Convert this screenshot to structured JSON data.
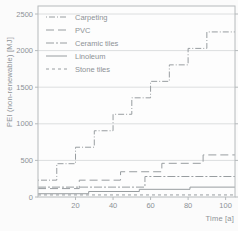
{
  "figure": {
    "background": "#fbfbfb",
    "line_color": "#989da0",
    "text_color": "#8d9296",
    "grid_color": "#dcdedf",
    "spine_color": "#b6babc"
  },
  "chart_data": {
    "type": "line",
    "subtype": "step-cumulative",
    "title": "",
    "xlabel": "Time [a]",
    "ylabel": "PEI (non-renewable) [MJ]",
    "xlim": [
      0,
      105
    ],
    "ylim": [
      0,
      2500
    ],
    "x_ticks": [
      20,
      40,
      60,
      80,
      100
    ],
    "y_ticks": [
      0,
      500,
      1000,
      1500,
      2000,
      2500
    ],
    "grid": "horizontal",
    "legend_position": "top-left",
    "series": [
      {
        "name": "Carpeting",
        "style": "dot-dash",
        "dash": "1 2 6 2",
        "start": 230,
        "steps": [
          [
            10,
            455
          ],
          [
            20,
            680
          ],
          [
            30,
            905
          ],
          [
            40,
            1130
          ],
          [
            50,
            1355
          ],
          [
            60,
            1580
          ],
          [
            70,
            1805
          ],
          [
            80,
            2030
          ],
          [
            90,
            2255
          ]
        ]
      },
      {
        "name": "PVC",
        "style": "long-dash",
        "dash": "8 4",
        "start": 115,
        "steps": [
          [
            22,
            230
          ],
          [
            44,
            345
          ],
          [
            66,
            460
          ],
          [
            88,
            575
          ]
        ]
      },
      {
        "name": "Ceramic tiles",
        "style": "dash-dot",
        "dash": "8 2 2 2",
        "start": 135,
        "steps": [
          [
            57,
            280
          ]
        ]
      },
      {
        "name": "Linoleum",
        "style": "solid",
        "dash": "",
        "start": 45,
        "steps": [
          [
            27,
            75
          ],
          [
            54,
            105
          ],
          [
            81,
            135
          ]
        ]
      },
      {
        "name": "Stone tiles",
        "style": "short-dash",
        "dash": "3 3",
        "start": 28,
        "steps": []
      }
    ]
  }
}
